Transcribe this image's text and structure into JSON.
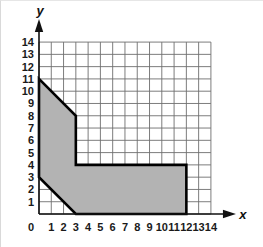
{
  "figure": {
    "title": "",
    "background_color": "#ffffff",
    "width": 263,
    "height": 247
  },
  "axes": {
    "x": {
      "name": "x",
      "ticks": [
        "0",
        "1",
        "2",
        "3",
        "4",
        "5",
        "6",
        "7",
        "8",
        "9",
        "10",
        "11",
        "12",
        "13",
        "14"
      ],
      "arrow": "right-arrow-icon"
    },
    "y": {
      "name": "y",
      "ticks": [
        "1",
        "2",
        "3",
        "4",
        "5",
        "6",
        "7",
        "8",
        "9",
        "10",
        "11",
        "12",
        "13",
        "14"
      ],
      "arrow": "up-arrow-icon"
    },
    "origin_label": "0"
  },
  "chart_data": {
    "type": "scatter",
    "title": "",
    "xlabel": "x",
    "ylabel": "y",
    "xlim": [
      0,
      14
    ],
    "ylim": [
      0,
      14
    ],
    "grid": true,
    "grid_step": 1,
    "legend": "none",
    "shapes": [
      {
        "name": "shaded-polygon",
        "kind": "polygon",
        "fill": "#b3b3b3",
        "stroke": "#000000",
        "stroke_width": 2.6,
        "vertices": [
          [
            0,
            11
          ],
          [
            3,
            8
          ],
          [
            3,
            4
          ],
          [
            12,
            4
          ],
          [
            12,
            0
          ],
          [
            3,
            0
          ],
          [
            0,
            3
          ]
        ]
      }
    ]
  },
  "style": {
    "grid_color": "#6e6e6e",
    "grid_faint_color": "#bdbdbd",
    "axis_color": "#111111",
    "fill_color": "#b3b3b3",
    "outline_color": "#000000",
    "text_color": "#1a1a1a"
  }
}
